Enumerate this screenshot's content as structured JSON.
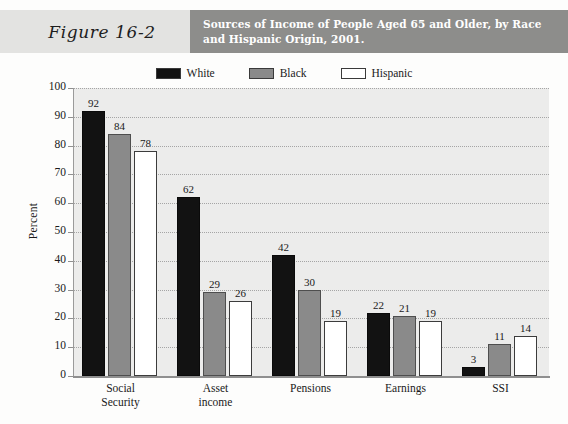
{
  "figure": {
    "label": "Figure 16-2",
    "title": "Sources of Income of People Aged 65 and Older, by Race and Hispanic Origin, 2001."
  },
  "colors": {
    "header_label_bg": "#e3e3e1",
    "header_title_bg": "#8d8d8b",
    "plot_bg": "#ececeb",
    "series_white": "#121212",
    "series_black": "#8a8a8a",
    "series_hispanic": "#ffffff"
  },
  "legend": {
    "items": [
      {
        "label": "White",
        "swatch": "#121212"
      },
      {
        "label": "Black",
        "swatch": "#8a8a8a"
      },
      {
        "label": "Hispanic",
        "swatch": "#ffffff"
      }
    ]
  },
  "axes": {
    "y_title": "Percent",
    "y_ticks": [
      "100",
      "90",
      "80",
      "70",
      "60",
      "50",
      "40",
      "30",
      "20",
      "10",
      "0"
    ]
  },
  "chart_data": {
    "type": "bar",
    "title": "Sources of Income of People Aged 65 and Older, by Race and Hispanic Origin, 2001.",
    "xlabel": "",
    "ylabel": "Percent",
    "ylim": [
      0,
      100
    ],
    "ytick_step": 10,
    "grid": true,
    "legend_position": "top-center",
    "categories": [
      "Social Security",
      "Asset income",
      "Pensions",
      "Earnings",
      "SSI"
    ],
    "category_lines": [
      [
        "Social",
        "Security"
      ],
      [
        "Asset",
        "income"
      ],
      [
        "Pensions"
      ],
      [
        "Earnings"
      ],
      [
        "SSI"
      ]
    ],
    "series": [
      {
        "name": "White",
        "values": [
          92,
          62,
          42,
          22,
          3
        ]
      },
      {
        "name": "Black",
        "values": [
          84,
          29,
          30,
          21,
          11
        ]
      },
      {
        "name": "Hispanic",
        "values": [
          78,
          26,
          19,
          19,
          14
        ]
      }
    ]
  }
}
